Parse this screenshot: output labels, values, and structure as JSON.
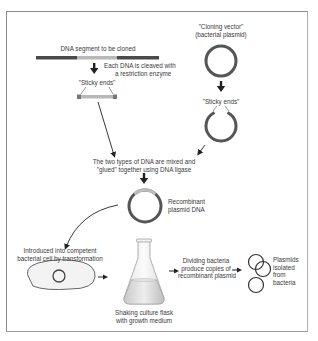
{
  "colors": {
    "frame": "#8a8a8a",
    "dna_dark": "#4a4a4a",
    "dna_insert": "#b8b8b8",
    "sticky_end": "#777777",
    "plasmid": "#555555",
    "arrow": "#222222",
    "text": "#3a3a3a"
  },
  "labels": {
    "dna_segment": "DNA segment to be cloned",
    "cloning_vector_line1": "\"Cloning vector\"",
    "cloning_vector_line2": "(bacterial plasmid)",
    "cleave_line1": "Each DNA is cleaved with",
    "cleave_line2": "a restriction enzyme",
    "sticky_ends_left": "\"Sticky ends\"",
    "sticky_ends_right": "\"Sticky ends\"",
    "ligase_line1": "The two types of DNA are mixed and",
    "ligase_line2": "\"glued\" together using DNA ligase",
    "recombinant_line1": "Recombinant",
    "recombinant_line2": "plasmid DNA",
    "transformation_line1": "Introduced into competent",
    "transformation_line2": "bacterial cell by transformation",
    "flask_line1": "Shaking culture flask",
    "flask_line2": "with growth medium",
    "dividing_line1": "Dividing bacteria",
    "dividing_line2": "produce copies of",
    "dividing_line3": "recombinant plasmid",
    "isolated_line1": "Plasmids",
    "isolated_line2": "isolated",
    "isolated_line3": "from",
    "isolated_line4": "bacteria"
  }
}
